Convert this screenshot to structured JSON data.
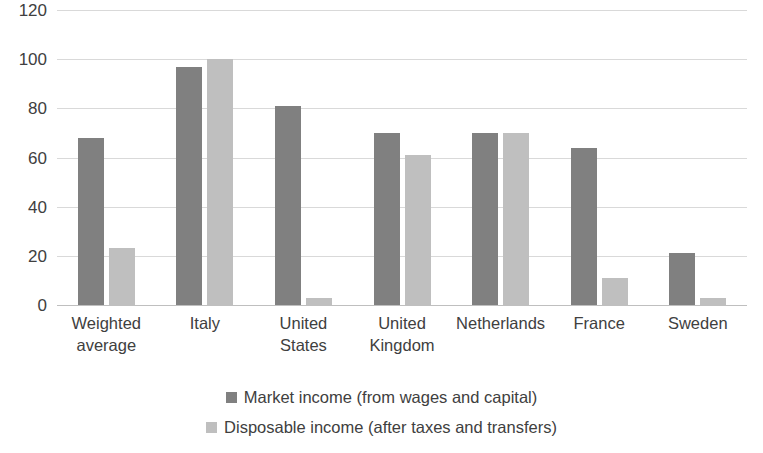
{
  "chart_data": {
    "type": "bar",
    "title": "",
    "subtitle": "",
    "xlabel": "",
    "ylabel": "",
    "ylim": [
      0,
      120
    ],
    "yticks": [
      0,
      20,
      40,
      60,
      80,
      100,
      120
    ],
    "ytick_labels": [
      "0",
      "20",
      "40",
      "60",
      "80",
      "100",
      "120"
    ],
    "grid": true,
    "legend_position": "bottom",
    "orientation": "vertical",
    "grouping": "grouped",
    "categories": [
      "Weighted average",
      "Italy",
      "United States",
      "United Kingdom",
      "Netherlands",
      "France",
      "Sweden"
    ],
    "series": [
      {
        "name": "Market income (from wages and capital)",
        "color": "#808080",
        "values": [
          68,
          97,
          81,
          70,
          70,
          64,
          21
        ]
      },
      {
        "name": "Disposable income (after taxes and transfers)",
        "color": "#bfbfbf",
        "values": [
          23,
          100,
          3,
          61,
          70,
          11,
          3
        ]
      }
    ]
  },
  "axis": {
    "y_tick_labels": [
      "120",
      "100",
      "80",
      "60",
      "40",
      "20",
      "0"
    ],
    "x_tick_labels": [
      "Weighted average",
      "Italy",
      "United States",
      "United Kingdom",
      "Netherlands",
      "France",
      "Sweden"
    ]
  },
  "legend": {
    "items": [
      {
        "label": "Market income (from wages and capital)",
        "color": "#808080"
      },
      {
        "label": "Disposable income (after taxes and transfers)",
        "color": "#bfbfbf"
      }
    ]
  },
  "colors": {
    "series_market_income": "#808080",
    "series_disposable_income": "#bfbfbf",
    "gridline": "#d9d9d9",
    "text": "#404040",
    "background": "#ffffff"
  }
}
